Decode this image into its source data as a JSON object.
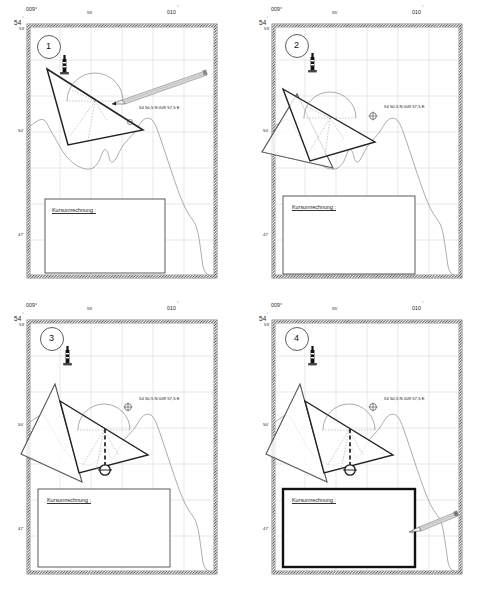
{
  "figure": {
    "panel_count": 4
  },
  "axes": {
    "top_left_lon": "009°",
    "top_mid_lon": "55'",
    "top_right_lon": "010",
    "top_right_deg": "°",
    "left_lat_top": "54",
    "left_lat_top_deg": "°",
    "left_ticks": [
      "53'",
      "50'",
      "47'"
    ]
  },
  "chart_label": {
    "position_text": "54 50,5 N 009 57,5 E",
    "box_label": "Kursumrechnung  :"
  },
  "panels": [
    {
      "number": "1",
      "caption": "Dreieck anlegen",
      "shows_pencil": true,
      "pencil_position": "upper-right pointing to triangle hypotenuse",
      "shows_crosshair": false,
      "shows_second_triangle": false,
      "shows_dashed_drop": false,
      "box_bold": false
    },
    {
      "number": "2",
      "caption": "Zweites Dreieck anlegen",
      "shows_pencil": false,
      "shows_crosshair": true,
      "shows_second_triangle": true,
      "shows_dashed_drop": false,
      "box_bold": false
    },
    {
      "number": "3",
      "caption": "Kurslinie markieren",
      "shows_pencil": false,
      "shows_crosshair": true,
      "shows_second_triangle": true,
      "shows_dashed_drop": true,
      "box_bold": false
    },
    {
      "number": "4",
      "caption": "Ergebnis eintragen",
      "shows_pencil": true,
      "pencil_position": "lower-right pointing to result box",
      "shows_crosshair": true,
      "shows_second_triangle": true,
      "shows_dashed_drop": true,
      "box_bold": true
    }
  ],
  "symbols": {
    "beacon": "lighthouse-beacon",
    "crosshair": "⊕",
    "circle_marker": "position-circle"
  },
  "colors": {
    "ink": "#222222",
    "grid": "#c9c9d6",
    "coast": "#8a8a8a",
    "pencil_body": "#d8d8d8",
    "pencil_edge": "#7a7a7a",
    "frame": "#3a3a3a"
  }
}
